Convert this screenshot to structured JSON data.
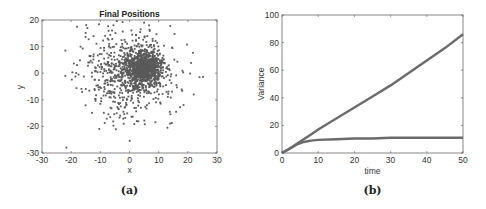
{
  "chart_data": [
    {
      "type": "scatter",
      "title": "Final Positions",
      "xlabel": "x",
      "ylabel": "y",
      "xlim": [
        -30,
        30
      ],
      "ylim": [
        -30,
        20
      ],
      "xticks": [
        -30,
        -20,
        -10,
        0,
        10,
        20,
        30
      ],
      "yticks": [
        -30,
        -20,
        -10,
        0,
        10,
        20
      ],
      "grid": false,
      "caption": "(a)",
      "clusters": [
        {
          "name": "wide cloud",
          "center": [
            0,
            0
          ],
          "spread": 8,
          "approx_points": 700
        },
        {
          "name": "dense cluster",
          "center": [
            5,
            2
          ],
          "spread": 3,
          "approx_points": 800
        }
      ],
      "outliers": [
        [
          -22,
          -1
        ],
        [
          -22,
          8.5
        ],
        [
          -18,
          17.5
        ],
        [
          -5.5,
          18
        ],
        [
          5,
          19
        ],
        [
          24,
          -1.5
        ],
        [
          22,
          -8
        ],
        [
          13,
          -20.5
        ],
        [
          -2,
          -19
        ],
        [
          2.5,
          -18
        ],
        [
          16,
          -14.5
        ]
      ]
    },
    {
      "type": "line",
      "title": "",
      "xlabel": "time",
      "ylabel": "Variance",
      "xlim": [
        0,
        50
      ],
      "ylim": [
        0,
        100
      ],
      "xticks": [
        0,
        10,
        20,
        30,
        40,
        50
      ],
      "yticks": [
        0,
        20,
        40,
        60,
        80,
        100
      ],
      "grid": false,
      "caption": "(b)",
      "x": [
        0,
        2,
        4,
        6,
        8,
        10,
        15,
        20,
        25,
        30,
        35,
        40,
        45,
        50
      ],
      "series": [
        {
          "name": "linear growth",
          "values": [
            0,
            3,
            6.5,
            10,
            13.5,
            17,
            25,
            33,
            41,
            49,
            58,
            67,
            76,
            86
          ]
        },
        {
          "name": "saturating",
          "values": [
            0,
            3,
            6,
            8,
            9,
            9.5,
            10,
            10.5,
            10.5,
            11,
            11,
            11,
            11,
            11
          ]
        }
      ]
    }
  ]
}
